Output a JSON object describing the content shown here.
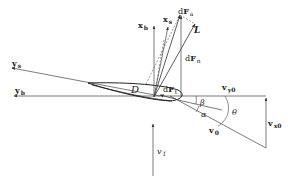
{
  "diagram": {
    "colors": {
      "stroke": "#333333",
      "background": "#ffffff"
    },
    "labels": {
      "xb": {
        "main": "x",
        "sub": "b"
      },
      "xs": {
        "main": "x",
        "sub": "s"
      },
      "dFa": {
        "prefix": "d",
        "main": "F",
        "sub": "a"
      },
      "L": {
        "main": "L"
      },
      "dFn": {
        "prefix": "d",
        "main": "F",
        "sub": "n"
      },
      "dFt": {
        "prefix": "d",
        "main": "F",
        "sub": "t"
      },
      "D": {
        "main": "D"
      },
      "ys": {
        "main": "y",
        "sub": "s"
      },
      "yb": {
        "main": "y",
        "sub": "b"
      },
      "vy0": {
        "main": "v",
        "sub": "y0"
      },
      "vx0": {
        "main": "v",
        "sub": "x0"
      },
      "v0": {
        "main": "v",
        "sub": "0"
      },
      "v1": {
        "main": "v",
        "sub": "1"
      },
      "beta": "β",
      "alpha": "α",
      "theta": "θ"
    }
  }
}
